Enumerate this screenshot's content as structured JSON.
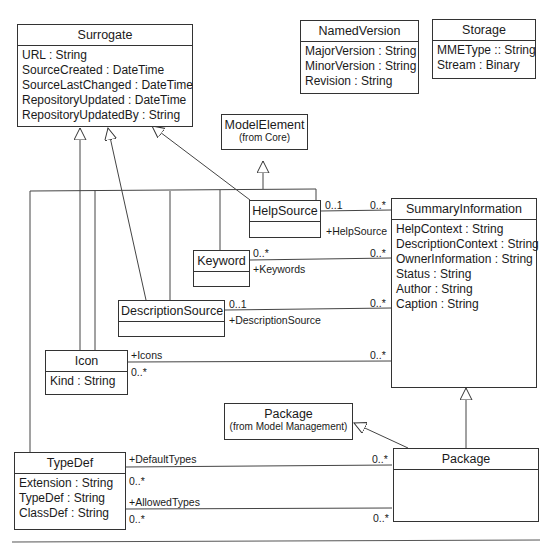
{
  "diagram": {
    "classes": {
      "surrogate": {
        "name": "Surrogate",
        "attributes": [
          "URL : String",
          "SourceCreated : DateTime",
          "SourceLastChanged : DateTime",
          "RepositoryUpdated : DateTime",
          "RepositoryUpdatedBy : String"
        ]
      },
      "named_version": {
        "name": "NamedVersion",
        "attributes": [
          "MajorVersion : String",
          "MinorVersion : String",
          "Revision : String"
        ]
      },
      "storage": {
        "name": "Storage",
        "attributes": [
          "MMEType :: String",
          "Stream : Binary"
        ]
      },
      "model_element": {
        "name": "ModelElement",
        "stereotype": "(from Core)"
      },
      "help_source": {
        "name": "HelpSource"
      },
      "keyword": {
        "name": "Keyword"
      },
      "description_source": {
        "name": "DescriptionSource"
      },
      "icon": {
        "name": "Icon",
        "attributes": [
          "Kind : String"
        ]
      },
      "summary_information": {
        "name": "SummaryInformation",
        "attributes": [
          "HelpContext : String",
          "DescriptionContext : String",
          "OwnerInformation : String",
          "Status : String",
          "Author : String",
          "Caption : String"
        ]
      },
      "package_mm": {
        "name": "Package",
        "stereotype": "(from Model Management)"
      },
      "package": {
        "name": "Package"
      },
      "typedef": {
        "name": "TypeDef",
        "attributes": [
          "Extension : String",
          "TypeDef : String",
          "ClassDef : String"
        ]
      }
    },
    "associations": {
      "help_source": {
        "left_mult": "0..1",
        "right_mult": "0..*",
        "role": "+HelpSource"
      },
      "keywords": {
        "left_mult": "0..*",
        "right_mult": "0..*",
        "role": "+Keywords"
      },
      "description_source": {
        "left_mult": "0..1",
        "right_mult": "0..*",
        "role": "+DescriptionSource"
      },
      "icons": {
        "left_mult": "0..*",
        "right_mult": "0..*",
        "role": "+Icons"
      },
      "default_types": {
        "left_mult": "0..*",
        "right_mult": "0..*",
        "role": "+DefaultTypes"
      },
      "allowed_types": {
        "left_mult": "0..*",
        "right_mult": "0..*",
        "role": "+AllowedTypes"
      }
    }
  }
}
